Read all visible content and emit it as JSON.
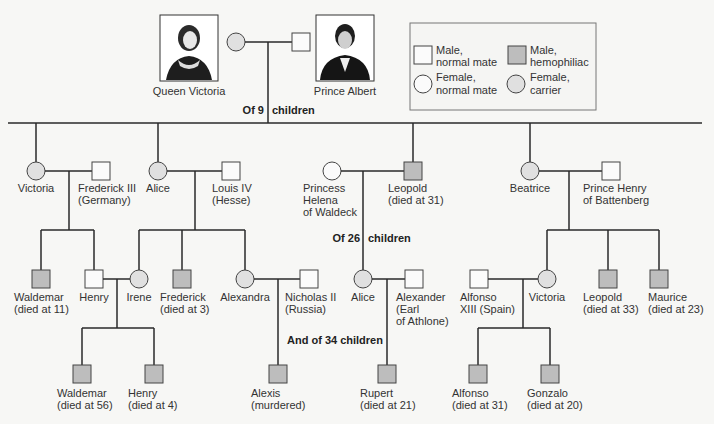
{
  "colors": {
    "background": "#f7f7f5",
    "male_hemophiliac": "#bdbdbd",
    "female_carrier": "#e0e0e0",
    "line": "#2a2a2a"
  },
  "legend": {
    "male_normal": [
      "Male,",
      "normal mate"
    ],
    "male_hemo": [
      "Male,",
      "hemophiliac"
    ],
    "female_normal": [
      "Female,",
      "normal mate"
    ],
    "female_carrier": [
      "Female,",
      "carrier"
    ]
  },
  "gen1": {
    "victoria": "Queen Victoria",
    "albert": "Prince Albert",
    "children_a": "Of 9",
    "children_b": "children"
  },
  "gen2": {
    "victoria": "Victoria",
    "frederick": [
      "Frederick III",
      "(Germany)"
    ],
    "alice": "Alice",
    "louis": [
      "Louis IV",
      "(Hesse)"
    ],
    "helena": [
      "Princess",
      "Helena",
      "of Waldeck"
    ],
    "leopold": [
      "Leopold",
      "(died at 31)"
    ],
    "beatrice": "Beatrice",
    "henry": [
      "Prince Henry",
      "of Battenberg"
    ],
    "children_a": "Of 26",
    "children_b": "children"
  },
  "gen3": {
    "waldemar": [
      "Waldemar",
      "(died at 11)"
    ],
    "henry": "Henry",
    "irene": "Irene",
    "frederick": [
      "Frederick",
      "(died at 3)"
    ],
    "alexandra": "Alexandra",
    "nicholas": [
      "Nicholas II",
      "(Russia)"
    ],
    "alice": "Alice",
    "alexander": [
      "Alexander",
      "(Earl",
      "of Athlone)"
    ],
    "alfonso": [
      "Alfonso",
      "XIII (Spain)"
    ],
    "victoria": "Victoria",
    "leopold": [
      "Leopold",
      "(died at 33)"
    ],
    "maurice": [
      "Maurice",
      "(died at 23)"
    ],
    "children_a": "And of 34 children"
  },
  "gen4": {
    "waldemar": [
      "Waldemar",
      "(died at 56)"
    ],
    "henry": [
      "Henry",
      "(died at 4)"
    ],
    "alexis": [
      "Alexis",
      "(murdered)"
    ],
    "rupert": [
      "Rupert",
      "(died at 21)"
    ],
    "alfonso": [
      "Alfonso",
      "(died at 31)"
    ],
    "gonzalo": [
      "Gonzalo",
      "(died at 20)"
    ]
  }
}
